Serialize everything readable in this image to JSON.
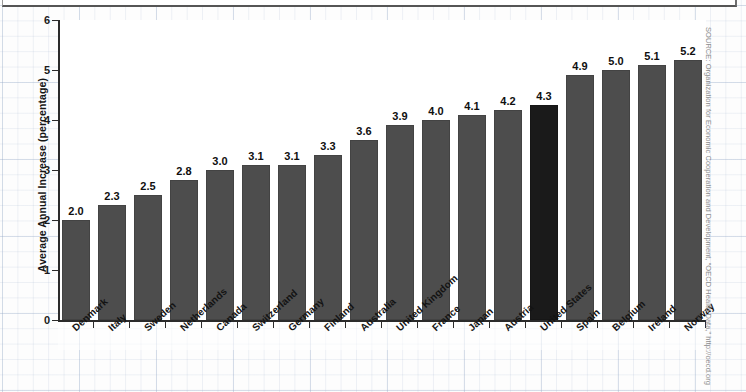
{
  "title_strip": {
    "ghost_text": ""
  },
  "chart_data": {
    "type": "bar",
    "title": "",
    "xlabel": "",
    "ylabel": "Average Annual Increase (percentage)",
    "ylim": [
      0,
      6
    ],
    "yticks": [
      "0",
      "1",
      "2",
      "3",
      "4",
      "5",
      "6"
    ],
    "grid": true,
    "legend": "none",
    "orientation": "vertical",
    "value_labels": true,
    "categories": [
      "Denmark",
      "Italy",
      "Sweden",
      "Netherlands",
      "Canada",
      "Switzerland",
      "Germany",
      "Finland",
      "Australia",
      "United Kingdom",
      "France",
      "Japan",
      "Austria",
      "United States",
      "Spain",
      "Belgium",
      "Ireland",
      "Norway"
    ],
    "values": [
      2.0,
      2.3,
      2.5,
      2.8,
      3.0,
      3.1,
      3.1,
      3.3,
      3.6,
      3.9,
      4.0,
      4.1,
      4.2,
      4.3,
      4.9,
      5.0,
      5.1,
      5.2
    ],
    "value_texts": [
      "2.0",
      "2.3",
      "2.5",
      "2.8",
      "3.0",
      "3.1",
      "3.1",
      "3.3",
      "3.6",
      "3.9",
      "4.0",
      "4.1",
      "4.2",
      "4.3",
      "4.9",
      "5.0",
      "5.1",
      "5.2"
    ],
    "highlight_category": "United States",
    "highlight_index": 13,
    "colors": {
      "bar": "#4d4d4d",
      "bar_highlight": "#1a1a1a",
      "axis": "#2b2b2b",
      "grid": "#96aac8",
      "text": "#131313",
      "source_text": "#8d8d8d",
      "plot_background": "#ffffff",
      "page_background": "#fdfdfd"
    }
  },
  "source": {
    "text": "SOURCE: Organization for Economic Cooperation and Development, “OECD Health Data,” http://oecd.org"
  }
}
